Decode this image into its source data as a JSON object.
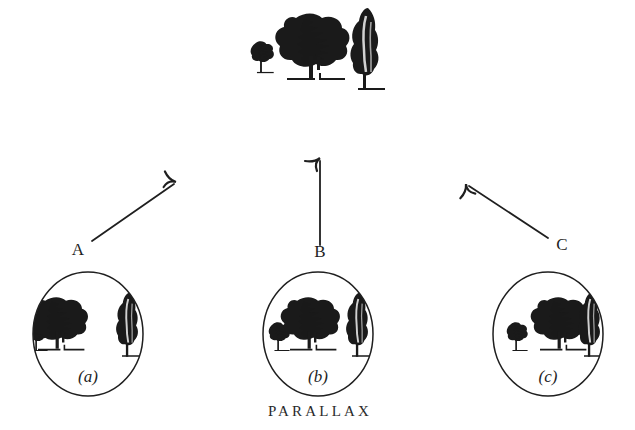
{
  "figure": {
    "caption": "PARALLAX",
    "title_semantic": "parallax-illustration",
    "background_color": "#ffffff",
    "ink_color": "#1a1a1a"
  },
  "scene": {
    "name": "distant-tree-scene",
    "trees": [
      {
        "id": "small-tree",
        "kind": "small-bushy-tree",
        "x": 268,
        "y": 78,
        "scale": 0.42
      },
      {
        "id": "big-tree",
        "kind": "large-leafy-tree",
        "x": 316,
        "y": 62,
        "scale": 1.0
      },
      {
        "id": "cypress-tree",
        "kind": "tall-cypress-tree",
        "x": 372,
        "y": 65,
        "scale": 1.0
      }
    ]
  },
  "viewpoints": [
    {
      "id": "A",
      "label": "A",
      "label_x": 76,
      "label_y": 254,
      "arrow_from": [
        92,
        240
      ],
      "arrow_to": [
        176,
        182
      ]
    },
    {
      "id": "B",
      "label": "B",
      "label_x": 316,
      "label_y": 256,
      "arrow_from": [
        320,
        244
      ],
      "arrow_to": [
        320,
        158
      ]
    },
    {
      "id": "C",
      "label": "C",
      "label_x": 558,
      "label_y": 250,
      "arrow_from": [
        545,
        238
      ],
      "arrow_to": [
        466,
        184
      ]
    }
  ],
  "views": [
    {
      "id": "view-a",
      "label": "(a)",
      "center_x": 88,
      "center_y": 334,
      "radius_x": 56,
      "radius_y": 63,
      "label_x": 88,
      "label_y": 380,
      "description": "View from position A",
      "trees": [
        {
          "kind": "small-bushy-tree",
          "x": 42,
          "y": 345,
          "scale": 0.46
        },
        {
          "kind": "large-leafy-tree",
          "x": 66,
          "y": 322,
          "scale": 0.72
        },
        {
          "kind": "tall-cypress-tree",
          "x": 128,
          "y": 318,
          "scale": 0.72
        }
      ]
    },
    {
      "id": "view-b",
      "label": "(b)",
      "center_x": 318,
      "center_y": 334,
      "radius_x": 56,
      "radius_y": 63,
      "label_x": 318,
      "label_y": 380,
      "description": "View from position B",
      "trees": [
        {
          "kind": "small-bushy-tree",
          "x": 283,
          "y": 345,
          "scale": 0.46
        },
        {
          "kind": "large-leafy-tree",
          "x": 315,
          "y": 322,
          "scale": 0.72
        },
        {
          "kind": "tall-cypress-tree",
          "x": 358,
          "y": 318,
          "scale": 0.72
        }
      ]
    },
    {
      "id": "view-c",
      "label": "(c)",
      "center_x": 548,
      "center_y": 334,
      "radius_x": 56,
      "radius_y": 63,
      "label_x": 548,
      "label_y": 380,
      "description": "View from position C",
      "trees": [
        {
          "kind": "small-bushy-tree",
          "x": 515,
          "y": 345,
          "scale": 0.46
        },
        {
          "kind": "large-leafy-tree",
          "x": 563,
          "y": 322,
          "scale": 0.72
        },
        {
          "kind": "tall-cypress-tree",
          "x": 589,
          "y": 318,
          "scale": 0.72
        }
      ]
    }
  ],
  "caption_position": {
    "x": 318,
    "y": 416
  }
}
